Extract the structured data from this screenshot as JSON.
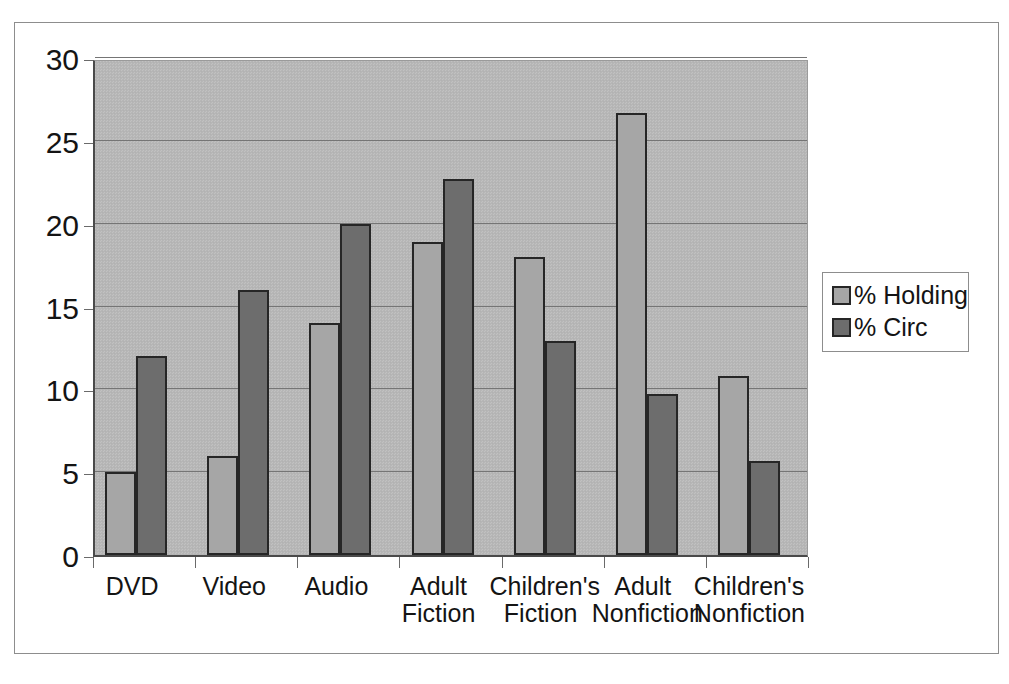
{
  "chart_data": {
    "type": "bar",
    "title": "",
    "subtitle": "",
    "xlabel": "",
    "ylabel": "",
    "ylim": [
      0,
      30
    ],
    "ytick_step": 5,
    "yticks": [
      0,
      5,
      10,
      15,
      20,
      25,
      30
    ],
    "ytick_labels": [
      "0",
      "5",
      "10",
      "15",
      "20",
      "25",
      "30"
    ],
    "grid": true,
    "grid_axis": "y",
    "legend_position": "right",
    "categories": [
      "DVD",
      "Video",
      "Audio",
      "Adult\nFiction",
      "Children's\nFiction",
      "Adult\nNonfiction",
      "Children's\nNonfiction"
    ],
    "series": [
      {
        "name": "% Holding",
        "color": "#a6a6a6",
        "values": [
          5.0,
          6.0,
          14.0,
          18.9,
          18.0,
          26.7,
          10.8
        ]
      },
      {
        "name": "% Circ",
        "color": "#6d6d6d",
        "values": [
          12.0,
          16.0,
          20.0,
          22.7,
          12.9,
          9.7,
          5.7
        ]
      }
    ],
    "plot_background": "#b7b7b7",
    "bar_edge_color": "#262626",
    "axis_color": "#4a4a4a",
    "gridline_color": "#757575",
    "text_color": "#141414"
  },
  "legend": {
    "entries": [
      {
        "label": "% Holding",
        "swatch": "holding"
      },
      {
        "label": "% Circ",
        "swatch": "circ"
      }
    ]
  }
}
